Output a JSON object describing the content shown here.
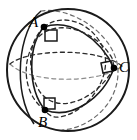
{
  "figure": {
    "background_color": "#ffffff",
    "stroke_color": "#1a1a1a",
    "dash_color": "#2b2b2b",
    "width": 137,
    "height": 140,
    "sphere": {
      "name": "sphere-outline",
      "center_x": 68,
      "center_y": 70,
      "radius": 61,
      "style": "solid"
    },
    "vertices": [
      {
        "id": "A",
        "label": "A",
        "x": 44,
        "y": 27,
        "marker": "filled-dot",
        "right_angle": true
      },
      {
        "id": "B",
        "label": "B",
        "x": 45,
        "y": 110,
        "marker": "filled-dot",
        "right_angle": true
      },
      {
        "id": "C",
        "label": "C",
        "x": 114,
        "y": 68,
        "marker": "filled-dot",
        "right_angle": true
      }
    ],
    "arcs": [
      {
        "id": "arc-AB",
        "from": "A",
        "to": "B",
        "style": "solid",
        "note": "near-side great-circle arc"
      },
      {
        "id": "arc-AC",
        "from": "A",
        "to": "C",
        "style": "solid",
        "note": "near-side great-circle arc"
      },
      {
        "id": "arc-BC",
        "from": "B",
        "to": "C",
        "style": "solid",
        "note": "near-side great-circle arc"
      },
      {
        "id": "arc-AB-back",
        "from": "A",
        "to": "B",
        "style": "dashed",
        "note": "far-side great-circle continuation"
      },
      {
        "id": "arc-AC-back",
        "from": "A",
        "to": "C",
        "style": "dashed",
        "note": "far-side great-circle continuation"
      },
      {
        "id": "arc-BC-back",
        "from": "B",
        "to": "C",
        "style": "dashed",
        "note": "far-side great-circle continuation"
      }
    ],
    "right_angle_markers": [
      {
        "at": "A",
        "style": "small-square",
        "size": 9
      },
      {
        "at": "B",
        "style": "small-square",
        "size": 9
      },
      {
        "at": "C",
        "style": "small-square",
        "size": 9
      }
    ]
  }
}
